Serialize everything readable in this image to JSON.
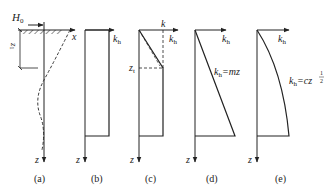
{
  "colors": {
    "ink": "#222222",
    "background": "#ffffff"
  },
  "panels": [
    {
      "id": "a",
      "caption": "(a)",
      "load_label": "H",
      "load_sub": "0",
      "x_axis_label": "x",
      "z_axis_label": "z",
      "depth_label": "z",
      "depth_sub": "1"
    },
    {
      "id": "b",
      "caption": "(b)",
      "k_label": "k",
      "k_sub": "h",
      "z_axis_label": "z"
    },
    {
      "id": "c",
      "caption": "(c)",
      "k_top_label": "k",
      "k_label": "k",
      "k_sub": "h",
      "depth_label": "z",
      "depth_sub": "t",
      "z_axis_label": "z"
    },
    {
      "id": "d",
      "caption": "(d)",
      "k_label": "k",
      "k_sub": "h",
      "formula_k": "k",
      "formula_sub": "h",
      "formula_rhs": "=mz",
      "z_axis_label": "z"
    },
    {
      "id": "e",
      "caption": "(e)",
      "k_label": "k",
      "k_sub": "h",
      "formula_k": "k",
      "formula_sub": "h",
      "formula_rhs": "=cz",
      "formula_exp_num": "1",
      "formula_exp_den": "2",
      "z_axis_label": "z"
    }
  ]
}
